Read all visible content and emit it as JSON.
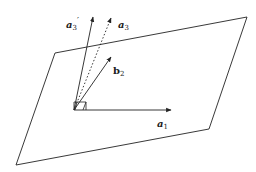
{
  "diagram": {
    "plane": {
      "corners": [
        [
          55,
          53
        ],
        [
          247,
          17
        ],
        [
          209,
          129
        ],
        [
          16,
          165
        ]
      ],
      "stroke": "#222222"
    },
    "origin": [
      74,
      110
    ],
    "vectors": [
      {
        "id": "a1",
        "name": "a",
        "sub": "1",
        "prime": "",
        "tip": [
          171,
          110
        ],
        "style": "solid",
        "label_pos": [
          157,
          127
        ]
      },
      {
        "id": "a3prime",
        "name": "a",
        "sub": "3",
        "prime": "′",
        "tip": [
          93,
          17
        ],
        "style": "solid",
        "label_pos": [
          66,
          28
        ]
      },
      {
        "id": "a3",
        "name": "a",
        "sub": "3",
        "prime": "",
        "tip": [
          111,
          18
        ],
        "style": "dotted",
        "label_pos": [
          118,
          28
        ]
      },
      {
        "id": "b2",
        "name": "b",
        "sub": "2",
        "prime": "",
        "tip": [
          111,
          57
        ],
        "style": "solid",
        "label_pos": [
          113,
          74
        ]
      }
    ],
    "right_angle_marker": true
  }
}
